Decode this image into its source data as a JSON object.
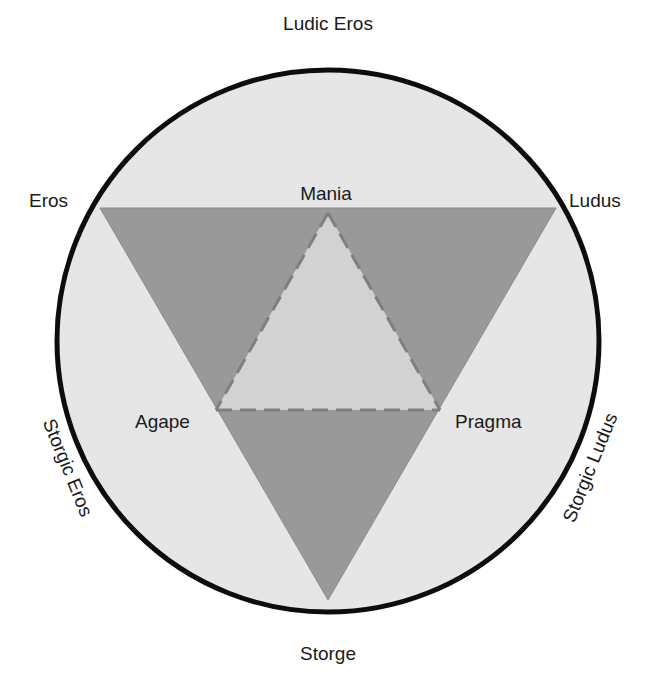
{
  "diagram": {
    "colors": {
      "background": "#ffffff",
      "circle_fill": "#e6e6e6",
      "circle_stroke": "#0d0d0d",
      "outer_triangle_fill": "#999999",
      "inner_triangle_fill": "#d2d2d2",
      "dashed_line": "#7f7f7f",
      "text": "#1a1a1a"
    },
    "labels": {
      "top": "Ludic Eros",
      "top_left": "Eros",
      "top_right": "Ludus",
      "mania": "Mania",
      "agape": "Agape",
      "pragma": "Pragma",
      "left_arc": "Storgic Eros",
      "right_arc": "Storgic Ludus",
      "bottom": "Storge"
    },
    "primary_styles": [
      "Eros",
      "Ludus",
      "Storge"
    ],
    "secondary_styles": [
      "Ludic Eros",
      "Storgic Eros",
      "Storgic Ludus"
    ],
    "mixture_styles": [
      "Mania",
      "Agape",
      "Pragma"
    ]
  }
}
